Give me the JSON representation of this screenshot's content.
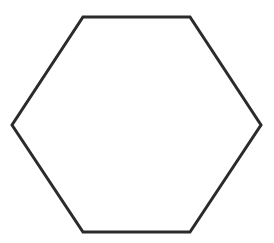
{
  "diagram": {
    "shape": "hexagon",
    "orientation": "flat-top",
    "points": [
      [
        83,
        17
      ],
      [
        190,
        17
      ],
      [
        261,
        125
      ],
      [
        190,
        232
      ],
      [
        83,
        232
      ],
      [
        12,
        125
      ]
    ],
    "stroke_color": "#2b2b2b",
    "stroke_width": 3,
    "fill_color": "#ffffff",
    "background_color": "#ffffff"
  }
}
